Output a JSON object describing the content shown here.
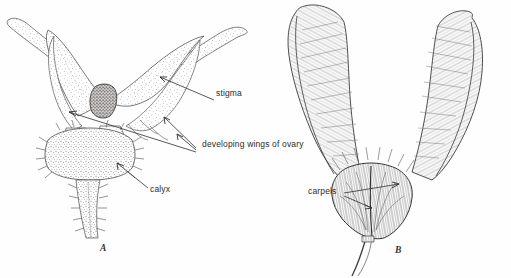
{
  "figure": {
    "kind": "botanical-line-illustration",
    "background_color": "#fffefe",
    "ink_color": "#3a3a3a",
    "panels": [
      {
        "id": "A",
        "letter": "A",
        "letter_position": {
          "x": 100,
          "y": 243
        },
        "description": "flower from above with spreading stigma lobes, developing ovary wings and hairy calyx",
        "texture": "stipple"
      },
      {
        "id": "B",
        "letter": "B",
        "letter_position": {
          "x": 395,
          "y": 245
        },
        "description": "pair of developing winged samaras with hairy carpel body and curved stalk",
        "texture": "hatching"
      }
    ],
    "labels": [
      {
        "id": "stigma",
        "text": "stigma",
        "x": 216,
        "y": 94,
        "panel": "A",
        "leaders": [
          {
            "from": [
              214,
              100
            ],
            "to": [
              159,
              77
            ]
          }
        ]
      },
      {
        "id": "developing-wings-of-ovary",
        "text": "developing wings of ovary",
        "x": 202,
        "y": 144,
        "panel": "A",
        "leaders": [
          {
            "from": [
              196,
              148
            ],
            "to": [
              163,
              116
            ]
          },
          {
            "from": [
              196,
              150
            ],
            "to": [
              176,
              133
            ]
          },
          {
            "from": [
              196,
              152
            ],
            "to": [
              68,
              112
            ]
          }
        ]
      },
      {
        "id": "calyx",
        "text": "calyx",
        "x": 150,
        "y": 190,
        "panel": "A",
        "leaders": [
          {
            "from": [
              148,
              189
            ],
            "to": [
              116,
              162
            ]
          }
        ]
      },
      {
        "id": "carpels",
        "text": "carpels",
        "x": 308,
        "y": 192,
        "panel": "B",
        "leaders": [
          {
            "from": [
              344,
              194
            ],
            "to": [
              398,
              184
            ]
          },
          {
            "from": [
              344,
              196
            ],
            "to": [
              371,
              207
            ]
          }
        ]
      }
    ]
  }
}
